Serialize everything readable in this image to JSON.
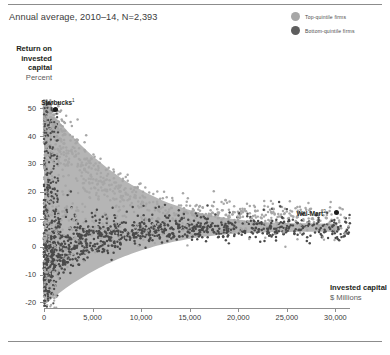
{
  "subtitle": "Annual average, 2010–14, N=2,393",
  "legend": {
    "items": [
      {
        "label": "Top-quintile firms",
        "color": "#a7a7a7"
      },
      {
        "label": "Bottom-quintile firms",
        "color": "#5e5e5e"
      }
    ]
  },
  "chart_data": {
    "type": "scatter",
    "title": "",
    "subtitle": "Annual average, 2010–14, N=2,393",
    "xlabel": "Invested capital",
    "xunit": "$ Millions",
    "ylabel": "Return on invested capital",
    "yunit": "Percent",
    "xlim": [
      0,
      31500
    ],
    "ylim": [
      -22,
      53
    ],
    "xticks": [
      0,
      5000,
      10000,
      15000,
      20000,
      25000,
      30000
    ],
    "xticklabels": [
      "0",
      "5,000",
      "10,000",
      "15,000",
      "20,000",
      "25,000",
      "30,000"
    ],
    "yticks": [
      -20,
      -10,
      0,
      10,
      20,
      30,
      40,
      50
    ],
    "yticklabels": [
      "-20",
      "-10",
      "0",
      "10",
      "20",
      "30",
      "40",
      "50"
    ],
    "grid": false,
    "legend_position": "top-right",
    "n": 2393,
    "series": [
      {
        "name": "Top-quintile firms",
        "color": "#a7a7a7",
        "marker": "circle"
      },
      {
        "name": "Bottom-quintile firms",
        "color": "#4a4a4a",
        "marker": "circle"
      }
    ],
    "band": {
      "note": "shaded funnel band narrowing left-to-right",
      "color": "#b5b5b5",
      "x_start": 0,
      "x_end": 30200,
      "y_upper_at_x_start": 52,
      "y_upper_at_x_end": 8.5,
      "y_lower_at_x_start": -21,
      "y_lower_at_x_end": 5.5
    },
    "annotations": [
      {
        "label": "Starbucks",
        "superscript": "1",
        "x": 1150,
        "y": 49.5,
        "dot_color": "#1a1a1a"
      },
      {
        "label": "Wal-Mart",
        "superscript": "2",
        "x": 30100,
        "y": 12.3,
        "dot_color": "#1a1a1a"
      }
    ]
  }
}
